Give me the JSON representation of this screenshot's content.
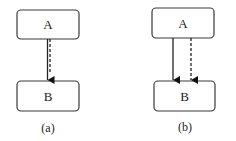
{
  "diagram": {
    "panels": [
      {
        "id": "a",
        "caption": "(a)",
        "nodes": [
          {
            "id": "A",
            "label": "A",
            "x": 17,
            "y": 10,
            "w": 62,
            "h": 29
          },
          {
            "id": "B",
            "label": "B",
            "x": 17,
            "y": 81,
            "w": 62,
            "h": 30
          }
        ],
        "edges": [
          {
            "from": "A",
            "to": "B",
            "style": "solid",
            "x": 47
          },
          {
            "from": "A",
            "to": "B",
            "style": "dashed",
            "x": 50
          }
        ],
        "caption_pos": {
          "x": 48,
          "y": 132
        }
      },
      {
        "id": "b",
        "caption": "(b)",
        "nodes": [
          {
            "id": "A",
            "label": "A",
            "x": 152,
            "y": 8,
            "w": 62,
            "h": 30
          },
          {
            "id": "B",
            "label": "B",
            "x": 154,
            "y": 81,
            "w": 61,
            "h": 30
          }
        ],
        "edges": [
          {
            "from": "A",
            "to": "B",
            "style": "solid",
            "x": 173
          },
          {
            "from": "A",
            "to": "B",
            "style": "dashed",
            "x": 191
          }
        ],
        "caption_pos": {
          "x": 185,
          "y": 131
        }
      }
    ],
    "colors": {
      "stroke": "#222222",
      "box_border": "#3a3a3a",
      "background": "#ffffff"
    }
  }
}
